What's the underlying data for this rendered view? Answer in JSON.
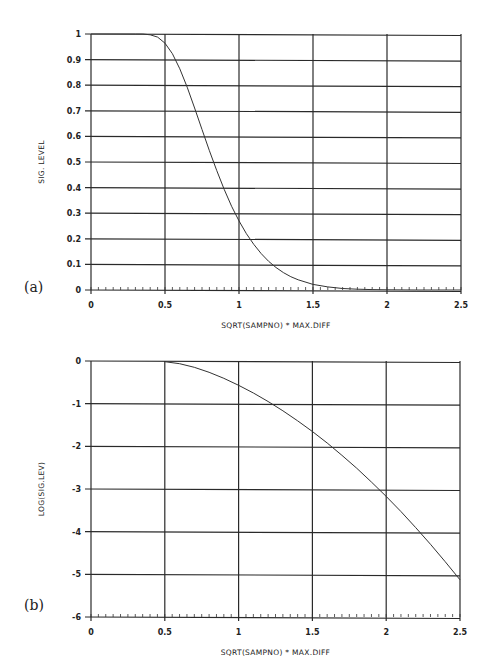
{
  "chart_data": [
    {
      "panel_label": "(a)",
      "type": "line",
      "title": "",
      "xlabel": "SQRT(SAMPNO) * MAX.DIFF",
      "ylabel": "SIG. LEVEL",
      "xlim": [
        0,
        2.5
      ],
      "ylim": [
        0,
        1
      ],
      "xticks": [
        "0",
        "0.5",
        "1",
        "1.5",
        "2",
        "2.5"
      ],
      "yticks": [
        "0",
        "0.1",
        "0.2",
        "0.3",
        "0.4",
        "0.5",
        "0.6",
        "0.7",
        "0.8",
        "0.9",
        "1"
      ],
      "grid": true,
      "legend": null,
      "series": [
        {
          "name": "sig_level",
          "x": [
            0,
            0.3,
            0.35,
            0.4,
            0.45,
            0.5,
            0.55,
            0.6,
            0.65,
            0.7,
            0.75,
            0.8,
            0.85,
            0.9,
            0.95,
            1.0,
            1.05,
            1.1,
            1.15,
            1.2,
            1.25,
            1.3,
            1.35,
            1.4,
            1.5,
            1.6,
            1.7,
            1.8,
            1.9,
            2.0,
            2.1,
            2.2,
            2.3,
            2.4,
            2.5
          ],
          "y": [
            1,
            1.0,
            1.0,
            0.997,
            0.988,
            0.964,
            0.923,
            0.864,
            0.792,
            0.711,
            0.627,
            0.544,
            0.466,
            0.393,
            0.327,
            0.27,
            0.22,
            0.178,
            0.142,
            0.112,
            0.088,
            0.068,
            0.052,
            0.04,
            0.022,
            0.012,
            0.006,
            0.003,
            0.0015,
            0.0007,
            0.0003,
            0.0001,
            5e-05,
            2e-05,
            1e-05
          ]
        }
      ]
    },
    {
      "panel_label": "(b)",
      "type": "line",
      "title": "",
      "xlabel": "SQRT(SAMPNO) * MAX.DIFF",
      "ylabel": "LOG(SIG.LEV)",
      "xlim": [
        0,
        2.5
      ],
      "ylim": [
        -6,
        0
      ],
      "xticks": [
        "0",
        "0.5",
        "1",
        "1.5",
        "2",
        "2.5"
      ],
      "yticks": [
        "-6",
        "-5",
        "-4",
        "-3",
        "-2",
        "-1",
        "0"
      ],
      "grid": true,
      "legend": null,
      "series": [
        {
          "name": "log_sig_level",
          "x": [
            0.5,
            0.6,
            0.7,
            0.8,
            0.9,
            1.0,
            1.1,
            1.2,
            1.3,
            1.4,
            1.5,
            1.6,
            1.7,
            1.8,
            1.9,
            2.0,
            2.1,
            2.2,
            2.3,
            2.4,
            2.5
          ],
          "y": [
            -0.016,
            -0.064,
            -0.148,
            -0.265,
            -0.406,
            -0.569,
            -0.75,
            -0.95,
            -1.167,
            -1.401,
            -1.653,
            -1.922,
            -2.209,
            -2.513,
            -2.835,
            -3.174,
            -3.53,
            -3.904,
            -4.295,
            -4.703,
            -5.128
          ]
        }
      ]
    }
  ]
}
